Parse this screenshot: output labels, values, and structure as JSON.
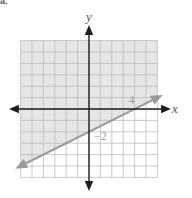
{
  "part_label": "a.",
  "chart_data": {
    "type": "line",
    "title": "",
    "xlabel": "x",
    "ylabel": "y",
    "xlim": [
      -6,
      6
    ],
    "ylim": [
      -6,
      6
    ],
    "grid": true,
    "boundary": {
      "equation": "y = 0.5x - 2",
      "slope": 0.5,
      "intercept": -2,
      "style": "solid",
      "points": [
        [
          -6,
          -5
        ],
        [
          6,
          1
        ]
      ]
    },
    "shaded_region": "above",
    "inequality": "y >= 0.5x - 2",
    "annotations": [
      {
        "text": "4",
        "x": 4,
        "y": 0,
        "meaning": "x-intercept"
      },
      {
        "text": "−2",
        "x": 0,
        "y": -2,
        "meaning": "y-intercept"
      }
    ],
    "colors": {
      "shade": "#e6e6e6",
      "grid": "#bdbdbd",
      "boundary": "#9a9a9a",
      "axes": "#1e1e1e"
    }
  }
}
